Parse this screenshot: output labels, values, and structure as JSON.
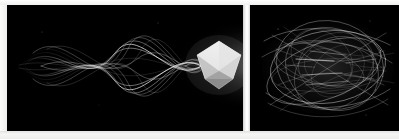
{
  "figure": {
    "title": "Two-panel long-exposure light trail comparison",
    "background_color": "#f4f4f2",
    "panel_background_color": "#000000",
    "trail_color": "#ffffff",
    "seam_color": "#ffffff"
  },
  "panels": [
    {
      "id": "left",
      "name": "Coherent braided light trails converging on a polyhedron",
      "caption": "",
      "background_color": "#000000",
      "x": 7,
      "y": 5,
      "width": 236,
      "height": 126,
      "content_summary": "Smooth braided sinusoidal light streaks sweeping left-to-right and converging into a bright faceted polyhedron at the right edge.",
      "solid": {
        "name": "icosahedron",
        "shape": "icosahedron",
        "center_x": 218,
        "center_y": 64,
        "radius": 24,
        "fill_color": "#d8d8d8",
        "highlight_color": "#ffffff",
        "shadow_color": "#6a6a6a"
      },
      "trails": {
        "type": "sinusoidal-braid",
        "count": 14,
        "direction": "left-to-right",
        "convergence_x": 200,
        "opacity_range": [
          0.25,
          0.95
        ]
      }
    },
    {
      "id": "right",
      "name": "Chaotic overlapping elliptical light trails",
      "caption": "",
      "background_color": "#000000",
      "x": 250,
      "y": 5,
      "width": 149,
      "height": 126,
      "content_summary": "Dense, disordered web of overlapping elliptical and arcing light streaks filling the frame with no central object.",
      "solid": null,
      "trails": {
        "type": "elliptical-tangle",
        "count": 26,
        "direction": "multi-directional",
        "convergence_x": null,
        "opacity_range": [
          0.15,
          0.9
        ]
      }
    }
  ],
  "chart_data": {
    "type": "scatter",
    "title": "Two-panel long-exposure light trail comparison",
    "xlabel": "",
    "ylabel": "",
    "series": [
      {
        "name": "left-panel-braided-trails",
        "description": "14 phase-shifted sine curves, amplitude decaying toward the right focus",
        "values": [
          14
        ]
      },
      {
        "name": "left-panel-polyhedron",
        "description": "Bright icosahedron terminating the trail bundle",
        "values": [
          1
        ]
      },
      {
        "name": "right-panel-tangled-trails",
        "description": "26 overlapping ellipses and arcs with randomized tilt",
        "values": [
          26
        ]
      }
    ]
  }
}
